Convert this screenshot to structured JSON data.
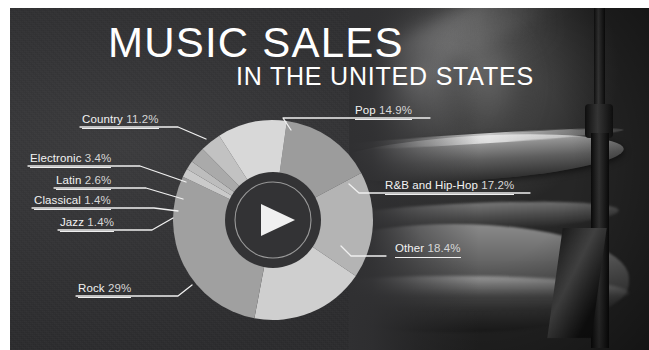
{
  "poster": {
    "title_main": "MUSIC SALES",
    "title_sub": "IN THE UNITED STATES",
    "background_color": "#313133",
    "accent_color": "#d9d9d9",
    "photo_subject": "drum-kit-cymbal-photo"
  },
  "center_icon": {
    "name": "play-button-icon",
    "disc_color": "#333335",
    "ring_color": "#9a9a9a"
  },
  "chart_data": {
    "type": "pie",
    "title": "MUSIC SALES",
    "subtitle": "IN THE UNITED STATES",
    "xlabel": "",
    "ylabel": "",
    "units": "percent",
    "donut": true,
    "legend": "callout-labels",
    "grid": false,
    "categories": [
      "Rock",
      "Other",
      "R&B and Hip-Hop",
      "Pop",
      "Country",
      "Electronic",
      "Latin",
      "Classical",
      "Jazz"
    ],
    "values": [
      29,
      18.4,
      17.2,
      14.9,
      11.2,
      3.4,
      2.6,
      1.4,
      1.4
    ],
    "labels": [
      "Rock 29%",
      "Other 18.4%",
      "R&B and Hip-Hop 17.2%",
      "Pop 14.9%",
      "Country 11.2%",
      "Electronic 3.4%",
      "Latin 2.6%",
      "Classical 1.4%",
      "Jazz 1.4%"
    ],
    "colors": [
      "#a0a0a0",
      "#cfcfcf",
      "#b4b4b4",
      "#9c9c9c",
      "#d8d8d8",
      "#c2c2c2",
      "#aaaaaa",
      "#bdbdbd",
      "#cacaca"
    ],
    "slices": [
      {
        "name": "Pop",
        "label": "Pop 14.9%",
        "value": 14.9,
        "color": "#9c9c9c"
      },
      {
        "name": "R&B and Hip-Hop",
        "label": "R&B and Hip-Hop 17.2%",
        "value": 17.2,
        "color": "#b4b4b4"
      },
      {
        "name": "Other",
        "label": "Other 18.4%",
        "value": 18.4,
        "color": "#cfcfcf"
      },
      {
        "name": "Rock",
        "label": "Rock 29%",
        "value": 29,
        "color": "#a0a0a0"
      },
      {
        "name": "Jazz",
        "label": "Jazz 1.4%",
        "value": 1.4,
        "color": "#cacaca"
      },
      {
        "name": "Classical",
        "label": "Classical 1.4%",
        "value": 1.4,
        "color": "#bdbdbd"
      },
      {
        "name": "Latin",
        "label": "Latin 2.6%",
        "value": 2.6,
        "color": "#aaaaaa"
      },
      {
        "name": "Electronic",
        "label": "Electronic 3.4%",
        "value": 3.4,
        "color": "#c2c2c2"
      },
      {
        "name": "Country",
        "label": "Country 11.2%",
        "value": 11.2,
        "color": "#d8d8d8"
      }
    ]
  },
  "callouts": {
    "left": [
      {
        "name": "Country",
        "text": "Country ",
        "pct": "11.2%"
      },
      {
        "name": "Electronic",
        "text": "Electronic ",
        "pct": "3.4%"
      },
      {
        "name": "Latin",
        "text": "Latin ",
        "pct": "2.6%"
      },
      {
        "name": "Classical",
        "text": "Classical ",
        "pct": "1.4%"
      },
      {
        "name": "Jazz",
        "text": "Jazz ",
        "pct": "1.4%"
      },
      {
        "name": "Rock",
        "text": "Rock ",
        "pct": "29%"
      }
    ],
    "right": [
      {
        "name": "Pop",
        "text": "Pop ",
        "pct": "14.9%"
      },
      {
        "name": "R&B and Hip-Hop",
        "text": "R&B and Hip-Hop ",
        "pct": "17.2%"
      },
      {
        "name": "Other",
        "text": "Other ",
        "pct": "18.4%"
      }
    ]
  }
}
